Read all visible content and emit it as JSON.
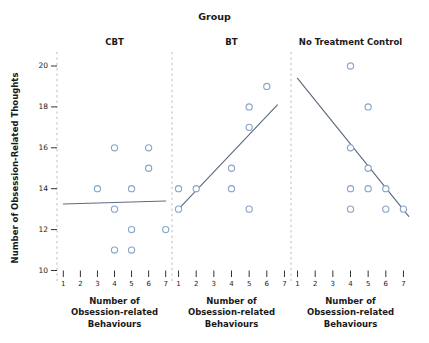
{
  "figure": {
    "group_title": "Group",
    "y_axis_label": "Number of Obsession-Related Thoughts",
    "x_axis_label_lines": [
      "Number of",
      "Obsession-related",
      "Behaviours"
    ],
    "colors": {
      "marker_stroke": "#8aa6c8",
      "marker_fill": "#ffffff",
      "fit_line": "#5f6b80",
      "divider": "#b9b9b9",
      "text": "#1a1a1a",
      "background": "#ffffff"
    }
  },
  "chart_data": {
    "type": "scatter",
    "title": "Group",
    "xlabel": "Number of Obsession-related Behaviours",
    "ylabel": "Number of Obsession-Related Thoughts",
    "grid": false,
    "legend": "none",
    "xlim": [
      1,
      7
    ],
    "ylim": [
      10,
      20
    ],
    "x_ticks": [
      1,
      2,
      3,
      4,
      5,
      6,
      7
    ],
    "y_ticks": [
      10,
      12,
      14,
      16,
      18,
      20
    ],
    "facet_variable": "Group",
    "panels": [
      {
        "label": "CBT",
        "points": [
          {
            "x": 3,
            "y": 14
          },
          {
            "x": 4,
            "y": 16
          },
          {
            "x": 4,
            "y": 13
          },
          {
            "x": 4,
            "y": 11
          },
          {
            "x": 5,
            "y": 14
          },
          {
            "x": 5,
            "y": 12
          },
          {
            "x": 5,
            "y": 11
          },
          {
            "x": 6,
            "y": 16
          },
          {
            "x": 6,
            "y": 15
          },
          {
            "x": 7,
            "y": 12
          }
        ],
        "fit_line": {
          "x1": 1,
          "y1": 13.25,
          "x2": 7,
          "y2": 13.4
        }
      },
      {
        "label": "BT",
        "points": [
          {
            "x": 1,
            "y": 14
          },
          {
            "x": 1,
            "y": 13
          },
          {
            "x": 2,
            "y": 14
          },
          {
            "x": 4,
            "y": 15
          },
          {
            "x": 4,
            "y": 14
          },
          {
            "x": 5,
            "y": 18
          },
          {
            "x": 5,
            "y": 17
          },
          {
            "x": 5,
            "y": 13
          },
          {
            "x": 6,
            "y": 19
          }
        ],
        "fit_line": {
          "x1": 1,
          "y1": 13,
          "x2": 6.6,
          "y2": 18.1
        }
      },
      {
        "label": "No Treatment Control",
        "points": [
          {
            "x": 4,
            "y": 20
          },
          {
            "x": 5,
            "y": 18
          },
          {
            "x": 4,
            "y": 16
          },
          {
            "x": 5,
            "y": 15
          },
          {
            "x": 4,
            "y": 14
          },
          {
            "x": 5,
            "y": 14
          },
          {
            "x": 6,
            "y": 14
          },
          {
            "x": 4,
            "y": 13
          },
          {
            "x": 6,
            "y": 13
          },
          {
            "x": 7,
            "y": 13
          }
        ],
        "fit_line": {
          "x1": 1,
          "y1": 19.4,
          "x2": 7.3,
          "y2": 12.65
        }
      }
    ]
  }
}
